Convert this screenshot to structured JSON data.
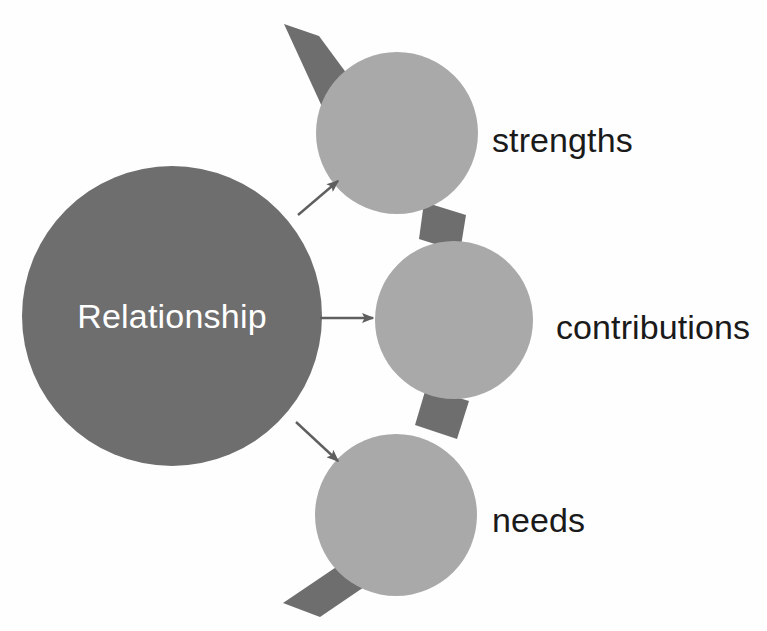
{
  "diagram": {
    "background_color": "#fefefe",
    "center_node": {
      "label": "Relationship",
      "fill_color": "#6e6e6e",
      "text_color": "#ffffff",
      "cx": 172,
      "cy": 316,
      "r": 150
    },
    "satellite_fill_color": "#a9a9a9",
    "band_color": "#6e6e6e",
    "arrow_color": "#5f5f5f",
    "label_color": "#1a1a1a",
    "nodes": [
      {
        "id": "strengths",
        "label": "strengths",
        "cx": 397,
        "cy": 133,
        "r": 81,
        "label_x": 492,
        "label_y": 152
      },
      {
        "id": "contributions",
        "label": "contributions",
        "cx": 454,
        "cy": 320,
        "r": 79,
        "label_x": 556,
        "label_y": 339
      },
      {
        "id": "needs",
        "label": "needs",
        "cx": 396,
        "cy": 515,
        "r": 81,
        "label_x": 492,
        "label_y": 532
      }
    ],
    "connectors": [
      {
        "id": "arrow-to-strengths",
        "from": "Relationship",
        "to": "strengths",
        "x1": 298,
        "y1": 215,
        "x2": 338,
        "y2": 181
      },
      {
        "id": "arrow-to-contributions",
        "from": "Relationship",
        "to": "contributions",
        "x1": 320,
        "y1": 318,
        "x2": 373,
        "y2": 318
      },
      {
        "id": "arrow-to-needs",
        "from": "Relationship",
        "to": "needs",
        "x1": 296,
        "y1": 422,
        "x2": 338,
        "y2": 461
      }
    ],
    "bands": [
      {
        "id": "band-top",
        "points": "284,24 319,36 364,97 324,111"
      },
      {
        "id": "band-upper-middle",
        "points": "424,202 466,215 460,252 419,239"
      },
      {
        "id": "band-middle-lower",
        "points": "426,388 469,401 457,439 415,425"
      },
      {
        "id": "band-bottom",
        "points": "357,553 395,566 320,617 283,603"
      }
    ]
  }
}
